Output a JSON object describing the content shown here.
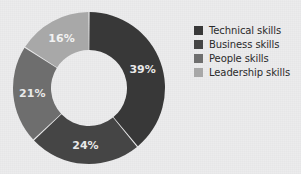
{
  "background_color": "#ececed",
  "chart_data": {
    "type": "pie",
    "variant": "donut",
    "title": "",
    "subtitle": "",
    "xlabel": "",
    "ylabel": "",
    "grid": false,
    "legend_position": "right",
    "start_angle_deg": 0,
    "direction": "clockwise",
    "inner_radius_ratio": 0.5,
    "categories": [
      "Technical skills",
      "Business  skills",
      "People skills",
      "Leadership skills"
    ],
    "values": [
      39,
      24,
      21,
      16
    ],
    "value_unit": "%",
    "data_labels": [
      "39%",
      "24%",
      "21%",
      "16%"
    ],
    "colors": [
      "#383838",
      "#454545",
      "#6e6e6e",
      "#a8a8a8"
    ],
    "label_color": "#ececec",
    "slices": [
      {
        "label": "Technical skills",
        "value": 39,
        "display": "39%",
        "color": "#383838"
      },
      {
        "label": "Business  skills",
        "value": 24,
        "display": "24%",
        "color": "#454545"
      },
      {
        "label": "People skills",
        "value": 21,
        "display": "21%",
        "color": "#6e6e6e"
      },
      {
        "label": "Leadership skills",
        "value": 16,
        "display": "16%",
        "color": "#a8a8a8"
      }
    ]
  },
  "legend": {
    "items": [
      {
        "label": "Technical skills",
        "color": "#383838"
      },
      {
        "label": "Business  skills",
        "color": "#454545"
      },
      {
        "label": "People skills",
        "color": "#6e6e6e"
      },
      {
        "label": "Leadership skills",
        "color": "#a8a8a8"
      }
    ]
  },
  "labels": {
    "technical": "39%",
    "business": "24%",
    "people": "21%",
    "leadership": "16%"
  }
}
